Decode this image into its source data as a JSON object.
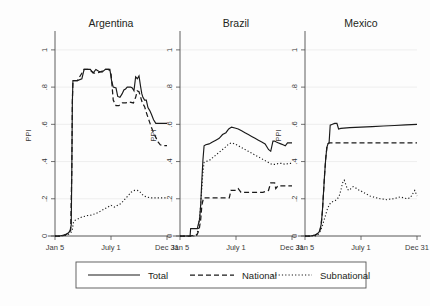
{
  "chart_data": {
    "type": "line",
    "title": "",
    "ylabel": "PPI",
    "xlabel": "",
    "ylim": [
      0,
      1.08
    ],
    "yticks": [
      0,
      0.2,
      0.4,
      0.6,
      0.8,
      1
    ],
    "ytick_labels": [
      "0",
      ".2",
      ".4",
      ".6",
      ".8",
      "1"
    ],
    "xticks": [
      0,
      0.5,
      1
    ],
    "xtick_labels": [
      "Jan 5",
      "July 1",
      "Dec 31"
    ],
    "grid": true,
    "legend_position": "bottom",
    "legend_entries": [
      "Total",
      "National",
      "Subnational"
    ],
    "panels": [
      {
        "title": "Argentina",
        "series": [
          {
            "name": "Total",
            "style": "solid",
            "x": [
              0,
              0.04,
              0.08,
              0.11,
              0.125,
              0.135,
              0.145,
              0.15,
              0.155,
              0.16,
              0.2,
              0.24,
              0.26,
              0.29,
              0.315,
              0.34,
              0.365,
              0.39,
              0.42,
              0.45,
              0.47,
              0.49,
              0.505,
              0.52,
              0.545,
              0.56,
              0.58,
              0.6,
              0.615,
              0.63,
              0.645,
              0.66,
              0.675,
              0.69,
              0.705,
              0.72,
              0.735,
              0.75,
              0.765,
              0.775,
              0.785,
              0.8,
              0.815,
              0.83,
              0.845,
              0.86,
              0.88,
              0.9,
              0.93,
              1.0
            ],
            "y": [
              0.0,
              0.0,
              0.005,
              0.012,
              0.02,
              0.03,
              0.06,
              0.35,
              0.72,
              0.835,
              0.835,
              0.845,
              0.895,
              0.895,
              0.895,
              0.875,
              0.895,
              0.885,
              0.88,
              0.895,
              0.895,
              0.895,
              0.835,
              0.8,
              0.795,
              0.75,
              0.745,
              0.765,
              0.785,
              0.79,
              0.8,
              0.8,
              0.8,
              0.795,
              0.78,
              0.855,
              0.845,
              0.86,
              0.8,
              0.765,
              0.745,
              0.73,
              0.73,
              0.69,
              0.675,
              0.655,
              0.625,
              0.605,
              0.605,
              0.605
            ]
          },
          {
            "name": "National",
            "style": "dashed",
            "x": [
              0,
              0.06,
              0.1,
              0.125,
              0.14,
              0.15,
              0.155,
              0.16,
              0.2,
              0.26,
              0.3,
              0.35,
              0.4,
              0.45,
              0.48,
              0.5,
              0.52,
              0.545,
              0.57,
              0.6,
              0.63,
              0.66,
              0.7,
              0.72,
              0.735,
              0.75,
              0.765,
              0.78,
              0.8,
              0.82,
              0.84,
              0.86,
              0.88,
              0.9,
              0.92,
              0.94,
              0.96,
              1.0
            ],
            "y": [
              0.0,
              0.0,
              0.008,
              0.02,
              0.03,
              0.35,
              0.72,
              0.835,
              0.835,
              0.895,
              0.895,
              0.875,
              0.88,
              0.895,
              0.895,
              0.875,
              0.73,
              0.7,
              0.7,
              0.715,
              0.715,
              0.72,
              0.715,
              0.745,
              0.78,
              0.775,
              0.745,
              0.715,
              0.695,
              0.655,
              0.62,
              0.585,
              0.555,
              0.53,
              0.505,
              0.49,
              0.485,
              0.485
            ]
          },
          {
            "name": "Subnational",
            "style": "dotted",
            "x": [
              0,
              0.06,
              0.1,
              0.13,
              0.145,
              0.155,
              0.165,
              0.18,
              0.2,
              0.23,
              0.26,
              0.29,
              0.32,
              0.35,
              0.38,
              0.41,
              0.44,
              0.47,
              0.5,
              0.53,
              0.56,
              0.59,
              0.62,
              0.65,
              0.68,
              0.71,
              0.735,
              0.755,
              0.775,
              0.795,
              0.82,
              0.85,
              0.88,
              0.92,
              0.96,
              1.0
            ],
            "y": [
              0.0,
              0.0,
              0.005,
              0.012,
              0.02,
              0.035,
              0.075,
              0.085,
              0.09,
              0.1,
              0.105,
              0.11,
              0.112,
              0.118,
              0.125,
              0.135,
              0.145,
              0.155,
              0.165,
              0.155,
              0.165,
              0.175,
              0.195,
              0.215,
              0.235,
              0.245,
              0.245,
              0.24,
              0.225,
              0.215,
              0.21,
              0.205,
              0.205,
              0.205,
              0.205,
              0.205
            ]
          }
        ]
      },
      {
        "title": "Brazil",
        "series": [
          {
            "name": "Total",
            "style": "solid",
            "x": [
              0,
              0.05,
              0.09,
              0.095,
              0.155,
              0.16,
              0.175,
              0.185,
              0.195,
              0.205,
              0.215,
              0.23,
              0.26,
              0.29,
              0.32,
              0.35,
              0.38,
              0.41,
              0.435,
              0.46,
              0.49,
              0.52,
              0.55,
              0.58,
              0.61,
              0.64,
              0.67,
              0.7,
              0.73,
              0.76,
              0.79,
              0.81,
              0.83,
              0.845,
              0.86,
              0.88,
              0.9,
              0.92,
              0.94,
              0.96,
              1.0
            ],
            "y": [
              0.0,
              0.0,
              0.0,
              0.04,
              0.04,
              0.055,
              0.09,
              0.17,
              0.3,
              0.41,
              0.485,
              0.49,
              0.495,
              0.505,
              0.515,
              0.525,
              0.545,
              0.555,
              0.575,
              0.585,
              0.58,
              0.575,
              0.565,
              0.555,
              0.545,
              0.535,
              0.525,
              0.515,
              0.505,
              0.495,
              0.465,
              0.455,
              0.51,
              0.51,
              0.505,
              0.5,
              0.495,
              0.49,
              0.485,
              0.5,
              0.5
            ]
          },
          {
            "name": "National",
            "style": "dashed",
            "x": [
              0,
              0.08,
              0.15,
              0.17,
              0.185,
              0.195,
              0.21,
              0.25,
              0.33,
              0.4,
              0.44,
              0.455,
              0.47,
              0.5,
              0.52,
              0.545,
              0.565,
              0.59,
              0.63,
              0.69,
              0.74,
              0.79,
              0.81,
              0.825,
              0.845,
              0.855,
              0.875,
              0.9,
              1.0
            ],
            "y": [
              0.0,
              0.0,
              0.005,
              0.03,
              0.09,
              0.165,
              0.205,
              0.205,
              0.205,
              0.205,
              0.205,
              0.245,
              0.245,
              0.245,
              0.255,
              0.235,
              0.235,
              0.235,
              0.235,
              0.235,
              0.235,
              0.245,
              0.285,
              0.285,
              0.285,
              0.255,
              0.27,
              0.27,
              0.27
            ]
          },
          {
            "name": "Subnational",
            "style": "dotted",
            "x": [
              0,
              0.08,
              0.135,
              0.15,
              0.165,
              0.18,
              0.195,
              0.205,
              0.215,
              0.23,
              0.26,
              0.29,
              0.32,
              0.35,
              0.38,
              0.41,
              0.435,
              0.46,
              0.49,
              0.52,
              0.55,
              0.58,
              0.61,
              0.64,
              0.67,
              0.7,
              0.73,
              0.76,
              0.79,
              0.82,
              0.85,
              0.88,
              0.91,
              0.94,
              0.97,
              1.0
            ],
            "y": [
              0.0,
              0.0,
              0.0,
              0.01,
              0.04,
              0.13,
              0.26,
              0.345,
              0.395,
              0.4,
              0.405,
              0.42,
              0.435,
              0.45,
              0.465,
              0.48,
              0.495,
              0.5,
              0.495,
              0.485,
              0.475,
              0.465,
              0.455,
              0.445,
              0.435,
              0.425,
              0.415,
              0.405,
              0.395,
              0.385,
              0.385,
              0.39,
              0.39,
              0.385,
              0.39,
              0.39
            ]
          }
        ]
      },
      {
        "title": "Mexico",
        "series": [
          {
            "name": "Total",
            "style": "solid",
            "x": [
              0,
              0.05,
              0.09,
              0.11,
              0.125,
              0.135,
              0.145,
              0.155,
              0.165,
              0.175,
              0.185,
              0.195,
              0.205,
              0.215,
              0.225,
              0.245,
              0.265,
              0.285,
              0.3,
              0.32,
              0.4,
              0.5,
              0.6,
              0.7,
              0.8,
              0.9,
              1.0
            ],
            "y": [
              0.0,
              0.0,
              0.005,
              0.012,
              0.02,
              0.035,
              0.065,
              0.13,
              0.23,
              0.33,
              0.415,
              0.475,
              0.495,
              0.5,
              0.595,
              0.6,
              0.605,
              0.605,
              0.575,
              0.578,
              0.582,
              0.585,
              0.588,
              0.591,
              0.594,
              0.597,
              0.6
            ]
          },
          {
            "name": "National",
            "style": "dashed",
            "x": [
              0,
              0.05,
              0.09,
              0.11,
              0.125,
              0.135,
              0.145,
              0.155,
              0.165,
              0.175,
              0.185,
              0.195,
              0.205,
              0.215,
              0.3,
              0.4,
              0.5,
              0.6,
              0.7,
              0.8,
              0.9,
              1.0
            ],
            "y": [
              0.0,
              0.0,
              0.005,
              0.012,
              0.02,
              0.035,
              0.065,
              0.13,
              0.23,
              0.33,
              0.415,
              0.475,
              0.495,
              0.5,
              0.5,
              0.5,
              0.5,
              0.5,
              0.5,
              0.5,
              0.5,
              0.5
            ]
          },
          {
            "name": "Subnational",
            "style": "dotted",
            "x": [
              0,
              0.05,
              0.09,
              0.11,
              0.125,
              0.14,
              0.155,
              0.17,
              0.185,
              0.2,
              0.215,
              0.23,
              0.25,
              0.27,
              0.29,
              0.305,
              0.32,
              0.335,
              0.35,
              0.365,
              0.38,
              0.395,
              0.41,
              0.43,
              0.45,
              0.47,
              0.49,
              0.52,
              0.55,
              0.58,
              0.61,
              0.64,
              0.67,
              0.7,
              0.73,
              0.76,
              0.79,
              0.82,
              0.85,
              0.88,
              0.91,
              0.94,
              0.96,
              0.98,
              1.0
            ],
            "y": [
              0.0,
              0.0,
              0.0,
              0.005,
              0.012,
              0.03,
              0.055,
              0.085,
              0.115,
              0.145,
              0.165,
              0.18,
              0.185,
              0.19,
              0.2,
              0.215,
              0.245,
              0.285,
              0.3,
              0.275,
              0.25,
              0.245,
              0.255,
              0.265,
              0.26,
              0.25,
              0.245,
              0.235,
              0.225,
              0.215,
              0.21,
              0.205,
              0.2,
              0.198,
              0.195,
              0.198,
              0.2,
              0.205,
              0.21,
              0.205,
              0.2,
              0.205,
              0.225,
              0.245,
              0.215
            ]
          }
        ]
      }
    ]
  }
}
